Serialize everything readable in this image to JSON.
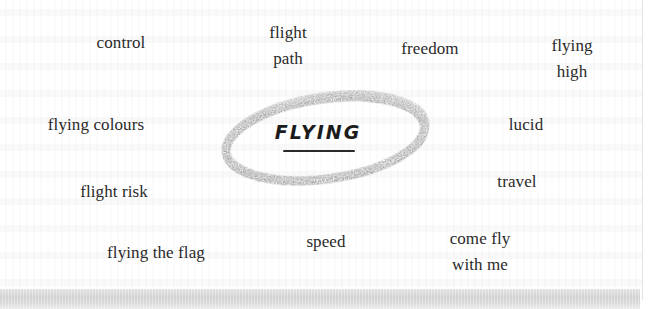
{
  "mindmap": {
    "center": {
      "label": "FLYING",
      "style": "hand-lettered, underlined, circled in grey pencil"
    },
    "words": [
      {
        "id": "control",
        "lines": [
          "control"
        ]
      },
      {
        "id": "flight-path",
        "lines": [
          "flight",
          "path"
        ]
      },
      {
        "id": "freedom",
        "lines": [
          "freedom"
        ]
      },
      {
        "id": "flying-high",
        "lines": [
          "flying",
          "high"
        ]
      },
      {
        "id": "flying-colours",
        "lines": [
          "flying colours"
        ]
      },
      {
        "id": "lucid",
        "lines": [
          "lucid"
        ]
      },
      {
        "id": "flight-risk",
        "lines": [
          "flight risk"
        ]
      },
      {
        "id": "travel",
        "lines": [
          "travel"
        ]
      },
      {
        "id": "flying-the-flag",
        "lines": [
          "flying the flag"
        ]
      },
      {
        "id": "speed",
        "lines": [
          "speed"
        ]
      },
      {
        "id": "come-fly-with-me",
        "lines": [
          "come fly",
          "with me"
        ]
      }
    ]
  },
  "colors": {
    "text": "#2a2a2a",
    "pencil": "#7a7a7a",
    "paper": "#ffffff",
    "shadow": "#d4d4d4"
  }
}
